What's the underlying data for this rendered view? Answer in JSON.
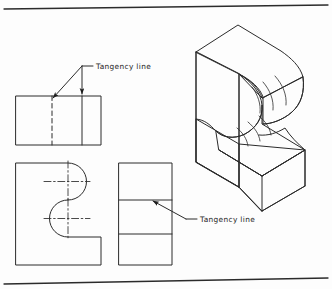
{
  "drawing": {
    "title": "Tangency line illustration - multiview and isometric",
    "background_color": "#fdfdfd",
    "line_color": "#2b2b2b",
    "rules": [
      {
        "name": "top-rule",
        "x1": 4,
        "y1": 9,
        "x2": 328,
        "y2": 5
      },
      {
        "name": "bottom-rule",
        "x1": 4,
        "y1": 284,
        "x2": 328,
        "y2": 278
      }
    ],
    "labels": [
      {
        "id": "label-top",
        "text": "Tangency line",
        "x": 94,
        "y": 71
      },
      {
        "id": "label-bottom",
        "text": "Tangency line",
        "x": 199,
        "y": 222
      }
    ],
    "leaders": {
      "top": {
        "dash_from_x": 85,
        "dash_from_y": 66,
        "vertex_x": 82,
        "vertex_y": 66,
        "arrow1_x": 52,
        "arrow1_y": 99,
        "arrow2_x": 82,
        "arrow2_y": 95
      },
      "bottom": {
        "dash_to_x": 196,
        "dash_to_y": 219,
        "bend_x": 186,
        "bend_y": 219,
        "arrow_x": 152,
        "arrow_y": 200
      }
    },
    "top_view": {
      "name": "top-view-rectangle",
      "x": 16,
      "y": 96,
      "width": 85,
      "height": 49,
      "dashed_line_x": 52,
      "solid_line_x": 82
    },
    "front_view": {
      "name": "front-view-s-profile",
      "left": 16,
      "top": 163,
      "right": 101,
      "bottom": 265,
      "notch_right": 101,
      "notch_y": 238,
      "curve_x": 68,
      "upper_center": {
        "x": 68,
        "y": 182
      },
      "lower_center": {
        "x": 68,
        "y": 219
      },
      "radius": 18
    },
    "side_view": {
      "name": "side-view-rectangle",
      "x": 119,
      "y": 163,
      "width": 53,
      "height": 102,
      "tangency_line_1_y": 200,
      "tangency_line_2_y": 234
    },
    "isometric": {
      "name": "isometric-s-block",
      "description": "S-curved solid block shown in isometric projection with contour lines on the curved faces"
    }
  }
}
